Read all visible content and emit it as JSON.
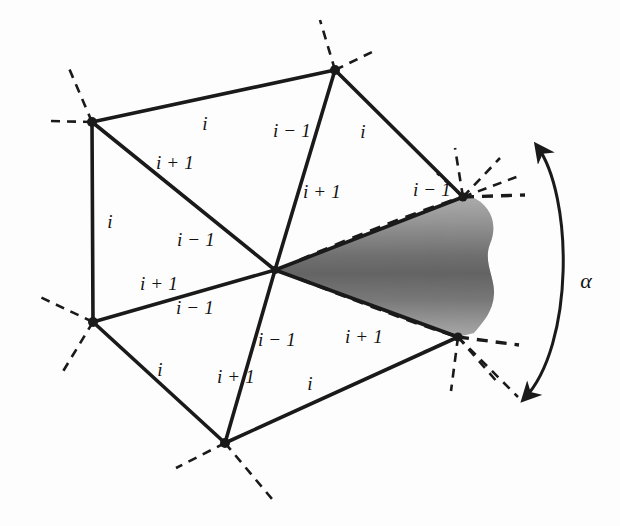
{
  "figure": {
    "colors": {
      "stroke": "#1a1a1a",
      "background": "#fdfdfd",
      "wedge_dark": "#6f6f6f",
      "wedge_light": "#d8d8d8"
    },
    "angle_label": "α",
    "edge_labels": [
      {
        "id": "e1",
        "text": "i",
        "x": 205,
        "y": 124
      },
      {
        "id": "e2",
        "text": "i − 1",
        "x": 292,
        "y": 131
      },
      {
        "id": "e3",
        "text": "i",
        "x": 363,
        "y": 132
      },
      {
        "id": "e4",
        "text": "i + 1",
        "x": 175,
        "y": 163
      },
      {
        "id": "e5",
        "text": "i + 1",
        "x": 322,
        "y": 192
      },
      {
        "id": "e6",
        "text": "i − 1",
        "x": 432,
        "y": 190
      },
      {
        "id": "e7",
        "text": "i",
        "x": 110,
        "y": 222
      },
      {
        "id": "e8",
        "text": "i − 1",
        "x": 196,
        "y": 240
      },
      {
        "id": "e9",
        "text": "i + 1",
        "x": 159,
        "y": 284
      },
      {
        "id": "e10",
        "text": "i − 1",
        "x": 195,
        "y": 308
      },
      {
        "id": "e11",
        "text": "i − 1",
        "x": 277,
        "y": 340
      },
      {
        "id": "e12",
        "text": "i + 1",
        "x": 364,
        "y": 337
      },
      {
        "id": "e13",
        "text": "i",
        "x": 160,
        "y": 370
      },
      {
        "id": "e14",
        "text": "i + 1",
        "x": 236,
        "y": 377
      },
      {
        "id": "e15",
        "text": "i",
        "x": 310,
        "y": 384
      },
      {
        "id": "e16",
        "text": "α",
        "x": 586,
        "y": 281
      }
    ],
    "vertices": [
      {
        "id": "center",
        "x": 275,
        "y": 270
      },
      {
        "id": "top",
        "x": 335,
        "y": 70
      },
      {
        "id": "upper-left",
        "x": 92,
        "y": 122
      },
      {
        "id": "lower-left",
        "x": 93,
        "y": 322
      },
      {
        "id": "bottom",
        "x": 225,
        "y": 443
      },
      {
        "id": "upper-right",
        "x": 463,
        "y": 197
      },
      {
        "id": "lower-right",
        "x": 458,
        "y": 337
      }
    ],
    "solid_edges": [
      [
        "center",
        "top"
      ],
      [
        "center",
        "upper-left"
      ],
      [
        "center",
        "lower-left"
      ],
      [
        "center",
        "bottom"
      ],
      [
        "center",
        "upper-right"
      ],
      [
        "center",
        "lower-right"
      ],
      [
        "upper-left",
        "top"
      ],
      [
        "upper-left",
        "lower-left"
      ],
      [
        "lower-left",
        "bottom"
      ],
      [
        "bottom",
        "lower-right"
      ],
      [
        "top",
        "upper-right"
      ]
    ]
  }
}
